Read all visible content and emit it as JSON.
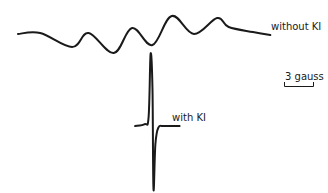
{
  "chart_data": {
    "type": "line",
    "title": "",
    "xlabel": "Magnetic field",
    "ylabel": "EPR signal (derivative)",
    "grid": false,
    "axes_visible": false,
    "series": [
      {
        "name": "without KI",
        "label": "without KI",
        "description": "Broad multi-line hyperfine EPR spectrum",
        "x": [
          0,
          2.3,
          5.6,
          7.3,
          9.9,
          11.8,
          13.9,
          15.9,
          18.2,
          20.6,
          21.8,
          24.3,
          26.1
        ],
        "y": [
          0.0,
          0.05,
          -0.65,
          0.05,
          -0.95,
          0.3,
          -0.55,
          0.9,
          0.0,
          0.8,
          0.35,
          0.1,
          -0.05
        ]
      },
      {
        "name": "with KI",
        "label": "with KI",
        "description": "Single sharp derivative line",
        "x": [
          11.7,
          12.7,
          13.1,
          13.3,
          13.5,
          13.6,
          13.8,
          14.1,
          14.7,
          16.3
        ],
        "y": [
          0.0,
          0.1,
          0.5,
          4.0,
          2.0,
          -3.5,
          -1.0,
          -0.1,
          0.0,
          0.0
        ]
      }
    ],
    "scale_bar": {
      "label": "3 gauss",
      "value": 3,
      "unit": "gauss"
    }
  }
}
